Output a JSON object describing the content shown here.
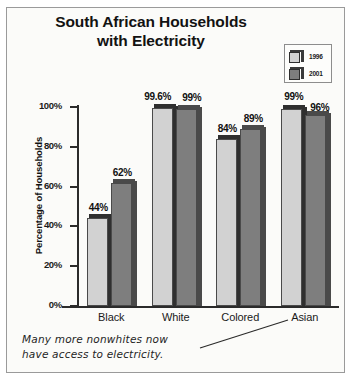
{
  "chart": {
    "title_line1": "South African Households",
    "title_line2": "with Electricity",
    "ylabel": "Percentage of Households",
    "legend": [
      {
        "label": "1996",
        "color": "#d2d2d2"
      },
      {
        "label": "2001",
        "color": "#7e7e7e"
      }
    ],
    "note_line1": "Many more nonwhites now",
    "note_line2": "have access to electricity."
  },
  "chart_data": {
    "type": "bar",
    "title": "South African Households with Electricity",
    "xlabel": "",
    "ylabel": "Percentage of Households",
    "ylim": [
      0,
      100
    ],
    "yticks": [
      0,
      20,
      40,
      60,
      80,
      100
    ],
    "ytick_labels": [
      "0%",
      "20%",
      "40%",
      "60%",
      "80%",
      "100%"
    ],
    "grid": false,
    "legend_position": "top-right",
    "categories": [
      "Black",
      "White",
      "Colored",
      "Asian"
    ],
    "series": [
      {
        "name": "1996",
        "color": "#d2d2d2",
        "values": [
          44,
          99.6,
          84,
          99
        ],
        "labels": [
          "44%",
          "99.6%",
          "84%",
          "99%"
        ]
      },
      {
        "name": "2001",
        "color": "#7e7e7e",
        "values": [
          62,
          99,
          89,
          96
        ],
        "labels": [
          "62%",
          "99%",
          "89%",
          "96%"
        ]
      }
    ],
    "annotation": "Many more nonwhites now have access to electricity."
  }
}
